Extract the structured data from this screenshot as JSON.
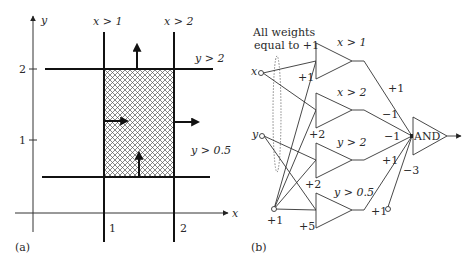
{
  "panel_a": {
    "caption": "(a)",
    "axes": {
      "x_label": "x",
      "y_label": "y",
      "x_ticks": [
        "1",
        "2"
      ],
      "y_ticks": [
        "1",
        "2"
      ]
    },
    "boundaries": [
      {
        "label": "x > 1"
      },
      {
        "label": "x > 2"
      },
      {
        "label": "y > 2"
      },
      {
        "label": "y > 0.5"
      }
    ],
    "region": "1 < x < 2, 0.5 < y < 2 (hatched)"
  },
  "panel_b": {
    "caption": "(b)",
    "note_line1": "All weights",
    "note_line2": "equal to +1",
    "inputs": {
      "x": "x",
      "y": "y",
      "bias": "+1"
    },
    "hidden_units": [
      {
        "label": "x > 1",
        "bias_weight": "+1",
        "out_weight": "+1"
      },
      {
        "label": "x > 2",
        "bias_weight": "+2",
        "out_weight": "−1"
      },
      {
        "label": "y > 2",
        "bias_weight": "+2",
        "out_weight": "−1"
      },
      {
        "label": "y > 0.5",
        "bias_weight": "+5",
        "out_weight": "+1"
      }
    ],
    "output_unit": {
      "label": "AND",
      "bias_input": "+1",
      "bias_weight": "−3"
    }
  },
  "colors": {
    "stroke": "#222222",
    "hatch": "#555555",
    "text": "#2a2a2a"
  }
}
